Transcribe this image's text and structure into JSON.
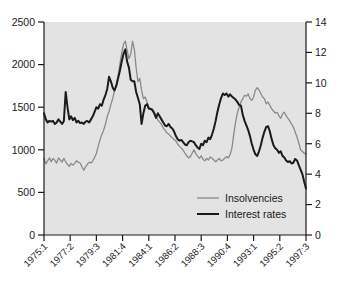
{
  "chart_data": {
    "type": "line",
    "title": "",
    "xlabel": "",
    "grid": false,
    "legend_position": "bottom-right",
    "x_tick_labels": [
      "1975:1",
      "1977:2",
      "1979:3",
      "1981:4",
      "1984:1",
      "1986:2",
      "1988:3",
      "1990:4",
      "1993:1",
      "1995:2",
      "1997:3"
    ],
    "left_axis": {
      "label": "Insolvencies",
      "ticks": [
        0,
        500,
        1000,
        1500,
        2000,
        2500
      ],
      "ylim": [
        0,
        2500
      ]
    },
    "right_axis": {
      "label": "Interest rates",
      "ticks": [
        0,
        2,
        4,
        6,
        8,
        10,
        12,
        14
      ],
      "ylim": [
        0,
        14
      ]
    },
    "series": [
      {
        "name": "Insolvencies",
        "axis": "left",
        "color": "#8a8a8a",
        "width": 1.3,
        "values": [
          900,
          835,
          870,
          905,
          860,
          900,
          875,
          845,
          905,
          880,
          855,
          900,
          860,
          830,
          805,
          840,
          820,
          840,
          870,
          855,
          845,
          800,
          760,
          800,
          830,
          855,
          845,
          870,
          910,
          960,
          1040,
          1120,
          1180,
          1230,
          1300,
          1390,
          1450,
          1530,
          1600,
          1690,
          1760,
          1870,
          2010,
          2140,
          2240,
          2275,
          2170,
          2070,
          2120,
          2275,
          2180,
          1960,
          1800,
          1840,
          1700,
          1600,
          1620,
          1560,
          1500,
          1470,
          1480,
          1445,
          1400,
          1350,
          1325,
          1300,
          1255,
          1230,
          1200,
          1185,
          1160,
          1140,
          1120,
          1105,
          1065,
          1040,
          1020,
          995,
          960,
          930,
          905,
          920,
          960,
          1000,
          955,
          925,
          900,
          930,
          890,
          870,
          900,
          880,
          915,
          900,
          880,
          860,
          880,
          900,
          870,
          880,
          900,
          920,
          905,
          945,
          1020,
          1180,
          1320,
          1430,
          1500,
          1560,
          1600,
          1640,
          1630,
          1655,
          1600,
          1580,
          1620,
          1700,
          1730,
          1700,
          1660,
          1620,
          1600,
          1540,
          1560,
          1520,
          1480,
          1455,
          1430,
          1440,
          1400,
          1370,
          1420,
          1440,
          1400,
          1370,
          1340,
          1300,
          1270,
          1210,
          1150,
          1080,
          1000,
          980,
          960,
          950
        ]
      },
      {
        "name": "Interest rates",
        "axis": "right",
        "color": "#1a1a1a",
        "width": 2.0,
        "values": [
          8.0,
          7.6,
          7.4,
          7.5,
          7.45,
          7.5,
          7.3,
          7.4,
          7.6,
          7.45,
          7.3,
          7.5,
          9.4,
          8.4,
          7.6,
          7.8,
          7.55,
          7.7,
          7.4,
          7.5,
          7.35,
          7.4,
          7.3,
          7.45,
          7.5,
          7.4,
          7.6,
          7.8,
          8.1,
          8.4,
          8.3,
          8.6,
          8.5,
          8.9,
          9.2,
          9.6,
          10.4,
          10.1,
          9.7,
          9.5,
          9.8,
          10.3,
          10.8,
          11.4,
          11.9,
          12.2,
          11.4,
          11.0,
          10.2,
          10.1,
          10.1,
          9.4,
          9.0,
          8.6,
          7.3,
          8.0,
          8.5,
          8.6,
          8.3,
          8.3,
          8.2,
          8.0,
          7.7,
          8.0,
          7.8,
          7.6,
          7.4,
          7.2,
          7.15,
          7.3,
          7.1,
          7.0,
          6.8,
          6.5,
          6.3,
          6.2,
          6.25,
          6.1,
          5.95,
          5.9,
          6.1,
          6.2,
          6.15,
          6.1,
          5.9,
          5.75,
          5.65,
          6.0,
          5.9,
          6.2,
          6.1,
          6.4,
          6.3,
          6.6,
          7.0,
          7.5,
          8.1,
          8.6,
          9.0,
          9.3,
          9.2,
          9.3,
          9.1,
          9.25,
          9.1,
          9.0,
          8.9,
          8.75,
          8.55,
          8.5,
          7.9,
          7.5,
          7.2,
          6.9,
          6.5,
          6.0,
          5.6,
          5.3,
          5.2,
          5.5,
          5.9,
          6.4,
          6.8,
          7.1,
          7.15,
          6.8,
          6.3,
          5.9,
          5.7,
          5.6,
          5.4,
          5.5,
          5.2,
          5.1,
          4.9,
          4.8,
          4.85,
          4.7,
          4.75,
          5.0,
          4.9,
          4.6,
          4.3,
          4.0,
          3.5,
          3.05
        ]
      }
    ]
  },
  "legend": {
    "items": [
      {
        "label": "Insolvencies",
        "color": "#8a8a8a"
      },
      {
        "label": "Interest rates",
        "color": "#1a1a1a"
      }
    ]
  },
  "style": {
    "plot_background": "#e3e3e3",
    "axis_color": "#1a1a1a",
    "page_background": "#ffffff"
  }
}
